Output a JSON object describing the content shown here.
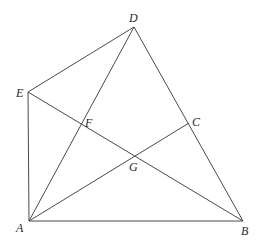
{
  "diagram": {
    "type": "geometry",
    "points": {
      "A": {
        "label": "A",
        "x": 29,
        "y": 221,
        "lx": 16,
        "ly": 232
      },
      "B": {
        "label": "B",
        "x": 243,
        "y": 221,
        "lx": 241,
        "ly": 235
      },
      "C": {
        "label": "C",
        "x": 189,
        "y": 123,
        "lx": 192,
        "ly": 126
      },
      "D": {
        "label": "D",
        "x": 134,
        "y": 27,
        "lx": 129,
        "ly": 22
      },
      "E": {
        "label": "E",
        "x": 28,
        "y": 92,
        "lx": 16,
        "ly": 97
      },
      "F": {
        "label": "F",
        "x": 80,
        "y": 123,
        "lx": 85,
        "ly": 127
      },
      "G": {
        "label": "G",
        "x": 134,
        "y": 155,
        "lx": 129,
        "ly": 171
      }
    },
    "segments": [
      [
        "D",
        "E"
      ],
      [
        "D",
        "A"
      ],
      [
        "D",
        "B"
      ],
      [
        "E",
        "A"
      ],
      [
        "E",
        "B"
      ],
      [
        "A",
        "B"
      ],
      [
        "A",
        "C"
      ]
    ],
    "line_color": "#4a4a4a"
  }
}
